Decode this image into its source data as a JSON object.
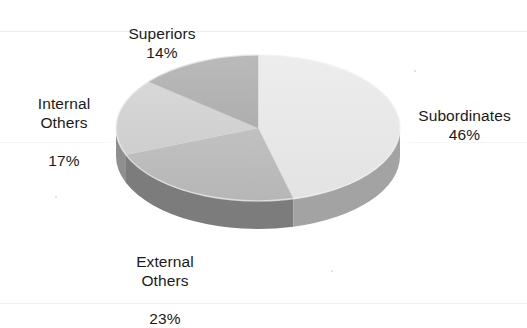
{
  "chart_data": {
    "type": "pie",
    "title": "",
    "subtitle": "",
    "xlabel": "",
    "ylabel": "",
    "legend_position": "none",
    "grid": false,
    "three_d": true,
    "start_angle_deg": 0,
    "direction": "clockwise",
    "categories": [
      "Subordinates",
      "External Others",
      "Internal Others",
      "Superiors"
    ],
    "values": [
      46,
      23,
      17,
      14
    ],
    "value_unit": "%",
    "slices": [
      {
        "label": "Subordinates",
        "value": 46,
        "value_text": "46%",
        "sweep_deg": 165.6,
        "top_color": "#e9e9e9",
        "side_color": "#a3a3a3"
      },
      {
        "label": "External Others",
        "value": 23,
        "value_text": "23%",
        "sweep_deg": 82.8,
        "top_color": "#bcbcbc",
        "side_color": "#7b7b7b"
      },
      {
        "label": "Internal Others",
        "value": 17,
        "value_text": "17%",
        "sweep_deg": 61.2,
        "top_color": "#d3d3d3",
        "side_color": "#8f8f8f"
      },
      {
        "label": "Superiors",
        "value": 14,
        "value_text": "14%",
        "sweep_deg": 50.4,
        "top_color": "#b4b4b4",
        "side_color": "#8a8a8a"
      }
    ]
  },
  "labels": {
    "superiors": {
      "name": "Superiors",
      "percent": "14%"
    },
    "internal_others": {
      "name_line1": "Internal",
      "name_line2": "Others",
      "percent": "17%"
    },
    "subordinates": {
      "name": "Subordinates",
      "percent": "46%"
    },
    "external_others": {
      "name_line1": "External",
      "name_line2": "Others",
      "percent": "23%"
    }
  },
  "colors": {
    "background": "#ffffff",
    "text": "#1a1a1a",
    "halo": "#ffffff",
    "subordinates": "#e9e9e9",
    "external_others": "#bcbcbc",
    "internal_others": "#d3d3d3",
    "superiors": "#b4b4b4"
  }
}
